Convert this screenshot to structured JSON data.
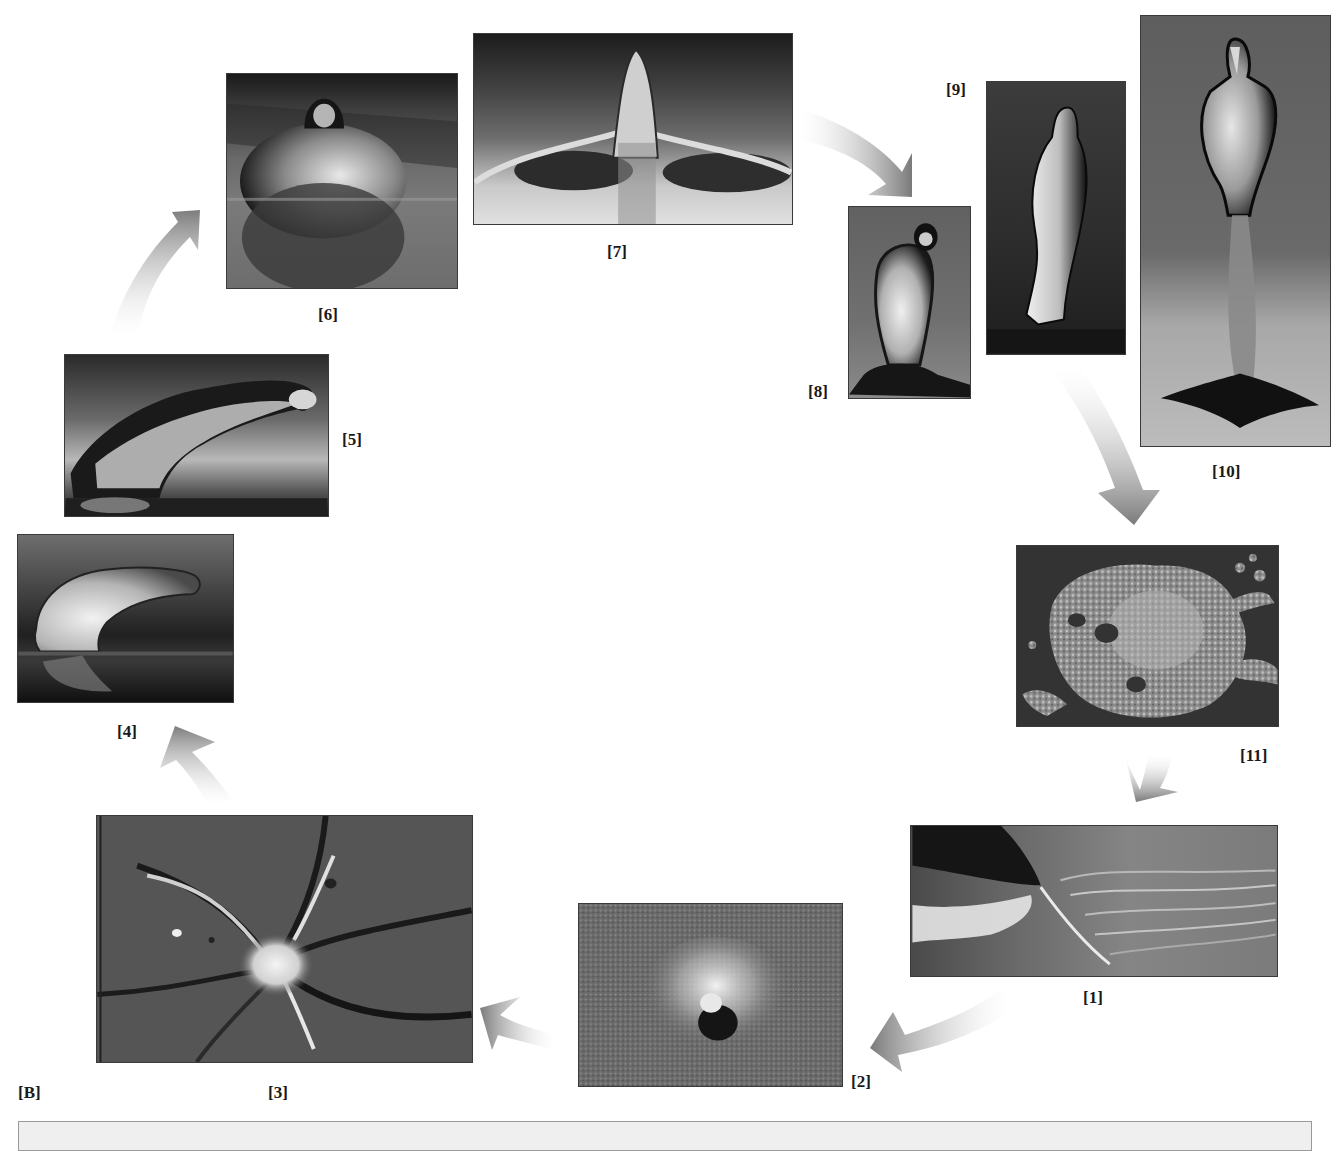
{
  "figure": {
    "panel_label": "[B]",
    "arrow_color": "#8a8a8a",
    "caption_box_color": "#efefef"
  },
  "stages": [
    {
      "id": 1,
      "label": "[1]"
    },
    {
      "id": 2,
      "label": "[2]"
    },
    {
      "id": 3,
      "label": "[3]"
    },
    {
      "id": 4,
      "label": "[4]"
    },
    {
      "id": 5,
      "label": "[5]"
    },
    {
      "id": 6,
      "label": "[6]"
    },
    {
      "id": 7,
      "label": "[7]"
    },
    {
      "id": 8,
      "label": "[8]"
    },
    {
      "id": 9,
      "label": "[9]"
    },
    {
      "id": 10,
      "label": "[10]"
    },
    {
      "id": 11,
      "label": "[11]"
    }
  ],
  "sequence_order": [
    "[1]",
    "[2]",
    "[3]",
    "[4]",
    "[5]",
    "[6]",
    "[7]",
    "[8]",
    "[9]",
    "[10]",
    "[11]",
    "[1]"
  ]
}
